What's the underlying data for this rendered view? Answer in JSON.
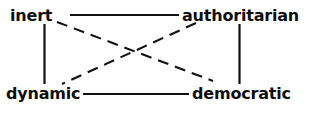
{
  "diagram": {
    "title": "",
    "background_color": "#ffffff",
    "line_color": "#111111",
    "text_color": "#0d0d0d",
    "nodes": [
      {
        "id": "inert",
        "label": "inert",
        "position": "top-left"
      },
      {
        "id": "authoritarian",
        "label": "authoritarian",
        "position": "top-right"
      },
      {
        "id": "dynamic",
        "label": "dynamic",
        "position": "bottom-left"
      },
      {
        "id": "democratic",
        "label": "democratic",
        "position": "bottom-right"
      }
    ],
    "edges": [
      {
        "id": "inert-authoritarian",
        "from": "inert",
        "to": "authoritarian",
        "style": "solid",
        "orientation": "horizontal"
      },
      {
        "id": "dynamic-democratic",
        "from": "dynamic",
        "to": "democratic",
        "style": "solid",
        "orientation": "horizontal"
      },
      {
        "id": "inert-dynamic",
        "from": "inert",
        "to": "dynamic",
        "style": "solid",
        "orientation": "vertical"
      },
      {
        "id": "authoritarian-democratic",
        "from": "authoritarian",
        "to": "democratic",
        "style": "solid",
        "orientation": "vertical"
      },
      {
        "id": "inert-democratic",
        "from": "inert",
        "to": "democratic",
        "style": "dashed",
        "orientation": "diagonal"
      },
      {
        "id": "authoritarian-dynamic",
        "from": "authoritarian",
        "to": "dynamic",
        "style": "dashed",
        "orientation": "diagonal"
      }
    ]
  }
}
